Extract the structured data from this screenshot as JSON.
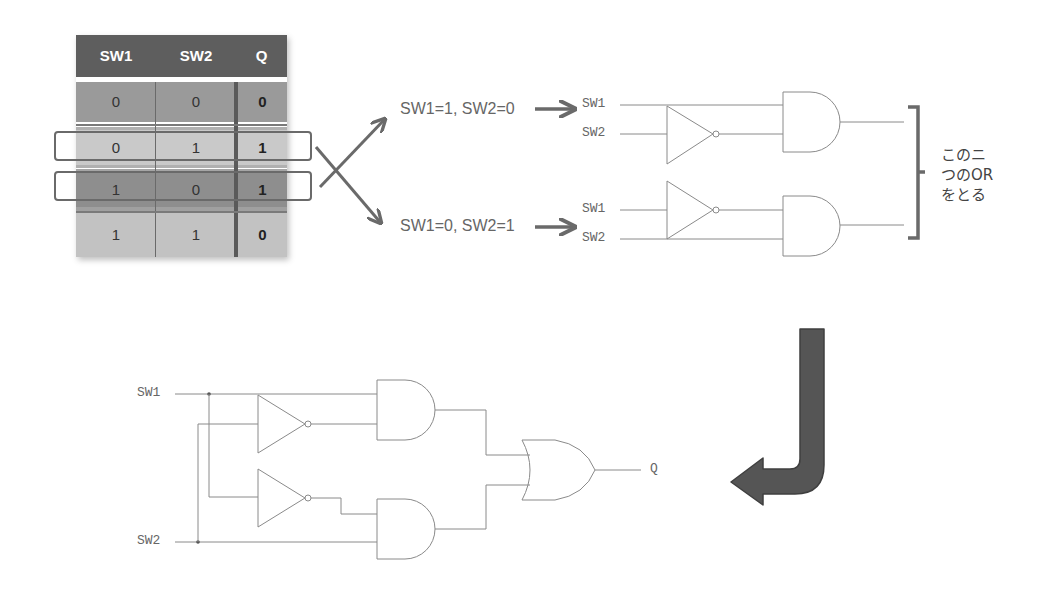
{
  "truth_table": {
    "headers": [
      "SW1",
      "SW2",
      "Q"
    ],
    "rows": [
      {
        "sw1": "0",
        "sw2": "0",
        "q": "0",
        "color": "#9a9a9a",
        "highlighted": false
      },
      {
        "sw1": "0",
        "sw2": "1",
        "q": "1",
        "color": "#c9c9c9",
        "highlighted": true
      },
      {
        "sw1": "1",
        "sw2": "0",
        "q": "1",
        "color": "#8e8e8e",
        "highlighted": true
      },
      {
        "sw1": "1",
        "sw2": "1",
        "q": "0",
        "color": "#c2c2c2",
        "highlighted": false
      }
    ]
  },
  "conditions": {
    "upper": "SW1=1, SW2=0",
    "lower": "SW1=0, SW2=1"
  },
  "upper_circuit": {
    "and1_inputs": [
      "SW1",
      "SW2"
    ],
    "and2_inputs": [
      "SW1",
      "SW2"
    ]
  },
  "note": {
    "line1": "このニ",
    "line2": "つのOR",
    "line3": "をとる"
  },
  "combined_circuit": {
    "input1": "SW1",
    "input2": "SW2",
    "output": "Q"
  },
  "colors": {
    "header": "#5e5e5e",
    "arrow": "#6a6a6a",
    "wire": "#8a8a8a",
    "big_arrow": "#505050"
  }
}
